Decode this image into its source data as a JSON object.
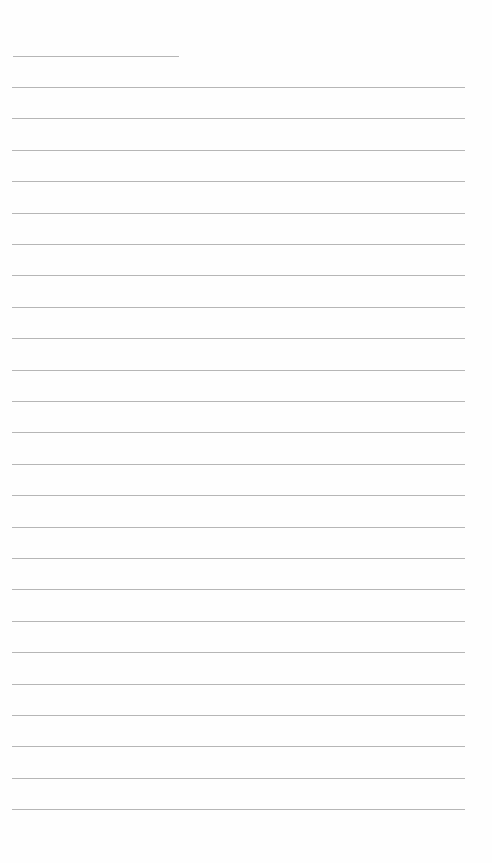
{
  "page": {
    "type": "lined-paper",
    "background_color": "#fefefe",
    "line_color": "#a9a9a9",
    "header_line": {
      "y": 56,
      "x_start": 13,
      "x_end": 179
    },
    "ruled_lines": {
      "x_start": 12,
      "x_end": 465,
      "y_positions": [
        87,
        118,
        150,
        181,
        213,
        244,
        275,
        307,
        338,
        370,
        401,
        432,
        464,
        495,
        527,
        558,
        589,
        621,
        652,
        684,
        715,
        746,
        778,
        809
      ]
    },
    "text": []
  }
}
